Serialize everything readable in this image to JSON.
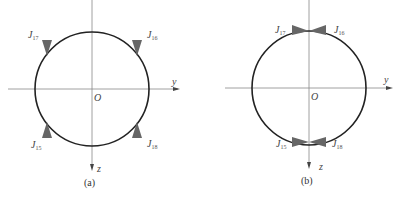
{
  "figures": [
    {
      "caption": "(a)",
      "origin_label": "O",
      "y_axis_label": "y",
      "z_axis_label": "z",
      "jets": [
        {
          "label": "J",
          "sub": "17",
          "position": "top-left"
        },
        {
          "label": "J",
          "sub": "16",
          "position": "top-right"
        },
        {
          "label": "J",
          "sub": "15",
          "position": "bottom-left"
        },
        {
          "label": "J",
          "sub": "18",
          "position": "bottom-right"
        }
      ]
    },
    {
      "caption": "(b)",
      "origin_label": "O",
      "y_axis_label": "y",
      "z_axis_label": "z",
      "jets": [
        {
          "label": "J",
          "sub": "17",
          "position": "top-left"
        },
        {
          "label": "J",
          "sub": "16",
          "position": "top-right"
        },
        {
          "label": "J",
          "sub": "15",
          "position": "bottom-left"
        },
        {
          "label": "J",
          "sub": "18",
          "position": "bottom-right"
        }
      ]
    }
  ],
  "colors": {
    "axis": "#888888",
    "circle": "#222222",
    "thruster": "#666666"
  }
}
